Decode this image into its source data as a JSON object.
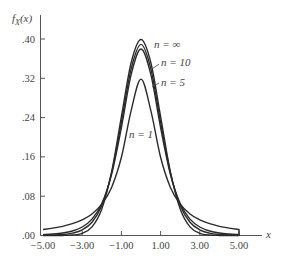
{
  "chart_data": {
    "type": "line",
    "title": "",
    "xlabel": "x",
    "ylabel": "f_X(x)",
    "ylabel_display": {
      "main": "f",
      "sub": "X",
      "arg": "(x)"
    },
    "xlim": [
      -5,
      5
    ],
    "ylim": [
      0,
      0.4
    ],
    "grid": false,
    "legend": "inline labels",
    "x_ticks": [
      -5,
      -3,
      -1,
      1,
      3,
      5
    ],
    "x_tick_labels": [
      "−5.00",
      "−3.00",
      "−1.00",
      "1.00",
      "3.00",
      "5.00"
    ],
    "y_ticks": [
      0,
      0.08,
      0.16,
      0.24,
      0.32,
      0.4
    ],
    "y_tick_labels": [
      ".00",
      ".08",
      ".16",
      ".24",
      ".32",
      ".40"
    ],
    "x": [
      -5,
      -4.5,
      -4,
      -3.5,
      -3,
      -2.5,
      -2,
      -1.5,
      -1,
      -0.5,
      0,
      0.5,
      1,
      1.5,
      2,
      2.5,
      3,
      3.5,
      4,
      4.5,
      5
    ],
    "series": [
      {
        "name": "n = ∞",
        "label": "n = ∞",
        "values": [
          0.0,
          0.0,
          0.0001,
          0.0009,
          0.0044,
          0.0175,
          0.054,
          0.1295,
          0.242,
          0.3521,
          0.3989,
          0.3521,
          0.242,
          0.1295,
          0.054,
          0.0175,
          0.0044,
          0.0009,
          0.0001,
          0.0,
          0.0
        ]
      },
      {
        "name": "n = 10",
        "label": "n = 10",
        "values": [
          0.0004,
          0.0009,
          0.002,
          0.0048,
          0.0114,
          0.0269,
          0.0611,
          0.1274,
          0.2304,
          0.3397,
          0.3891,
          0.3397,
          0.2304,
          0.1274,
          0.0611,
          0.0269,
          0.0114,
          0.0048,
          0.002,
          0.0009,
          0.0004
        ]
      },
      {
        "name": "n = 5",
        "label": "n = 5",
        "values": [
          0.0018,
          0.003,
          0.0051,
          0.0092,
          0.0173,
          0.0333,
          0.0651,
          0.1245,
          0.2197,
          0.3279,
          0.3796,
          0.3279,
          0.2197,
          0.1245,
          0.0651,
          0.0333,
          0.0173,
          0.0092,
          0.0051,
          0.003,
          0.0018
        ]
      },
      {
        "name": "n = 1",
        "label": "n = 1",
        "values": [
          0.0122,
          0.015,
          0.0187,
          0.0241,
          0.0318,
          0.0439,
          0.0637,
          0.0979,
          0.1592,
          0.2546,
          0.3183,
          0.2546,
          0.1592,
          0.0979,
          0.0637,
          0.0439,
          0.0318,
          0.0241,
          0.0187,
          0.015,
          0.0122
        ]
      }
    ]
  },
  "colors": {
    "curve": "#2a2a2a",
    "axis": "#555555",
    "text": "#444444",
    "background": "#ffffff"
  }
}
